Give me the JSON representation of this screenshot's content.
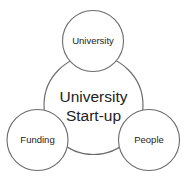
{
  "diagram": {
    "type": "venn-cluster",
    "title": "University Start-up",
    "background_color": "#ffffff",
    "stroke_color": "#6b6b6b",
    "text_color": "#222222",
    "core": {
      "label_line1": "University",
      "label_line2": "Start-up",
      "cx": 93.5,
      "cy": 105,
      "r": 49.5
    },
    "satellites": [
      {
        "id": "university",
        "label": "University",
        "cx": 93,
        "cy": 41,
        "r": 30.5
      },
      {
        "id": "funding",
        "label": "Funding",
        "cx": 37.5,
        "cy": 140,
        "r": 30.5
      },
      {
        "id": "people",
        "label": "People",
        "cx": 149,
        "cy": 140,
        "r": 30.5
      }
    ]
  }
}
